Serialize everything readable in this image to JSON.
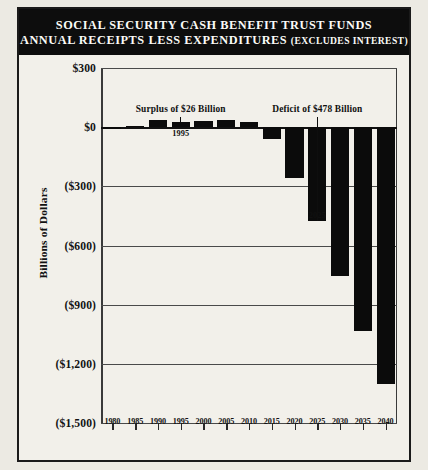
{
  "title": {
    "line1": "SOCIAL SECURITY CASH BENEFIT TRUST FUNDS",
    "line2_main": "ANNUAL RECEIPTS LESS EXPENDITURES ",
    "line2_paren": "(EXCLUDES INTEREST)"
  },
  "chart_data": {
    "type": "bar",
    "title": "SOCIAL SECURITY CASH BENEFIT TRUST FUNDS ANNUAL RECEIPTS LESS EXPENDITURES (EXCLUDES INTEREST)",
    "xlabel": "",
    "ylabel": "Billions of Dollars",
    "categories": [
      "1980",
      "1985",
      "1990",
      "1995",
      "2000",
      "2005",
      "2010",
      "2015",
      "2020",
      "2025",
      "2030",
      "2035",
      "2040"
    ],
    "values": [
      -5,
      8,
      36,
      26,
      30,
      34,
      24,
      -60,
      -260,
      -478,
      -755,
      -1035,
      -1300
    ],
    "ylim": [
      -1500,
      300
    ],
    "ytick_labels": [
      "$300",
      "$0",
      "($300)",
      "($600)",
      "($900)",
      "($1,200)",
      "($1,500)"
    ],
    "ytick_values": [
      300,
      0,
      -300,
      -600,
      -900,
      -1200,
      -1500
    ],
    "grid": true,
    "legend": "none",
    "series_color": "#0b0b0b",
    "annotations": [
      {
        "text": "Surplus of $26 Billion",
        "points_to_category": "1995",
        "value": 26
      },
      {
        "text": "Deficit of $478 Billion",
        "points_to_category": "2025",
        "value": -478
      }
    ],
    "point_labels": [
      {
        "text": "1995",
        "category": "1995"
      },
      {
        "text": "2025",
        "category": "2025"
      }
    ]
  },
  "colors": {
    "banner_bg": "#0d0d0d",
    "banner_text": "#fbfbf8",
    "bar": "#0b0b0b",
    "paper": "#f2f0ea",
    "grid": "#4a4a4a"
  }
}
